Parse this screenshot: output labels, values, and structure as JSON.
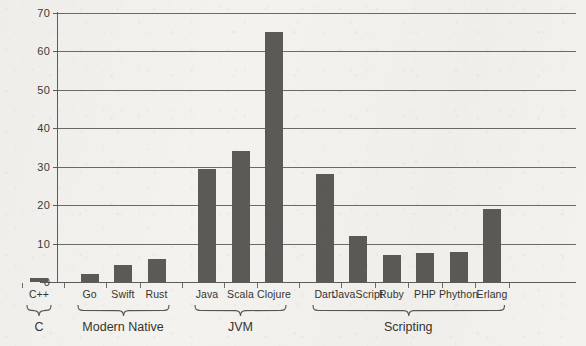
{
  "chart_data": {
    "type": "bar",
    "title": "",
    "subtitle": "",
    "xlabel": "",
    "ylabel": "",
    "ylim": [
      0,
      70
    ],
    "yticks": [
      0,
      10,
      20,
      30,
      40,
      50,
      60,
      70
    ],
    "grid": true,
    "legend": false,
    "categories": [
      "C++",
      "Go",
      "Swift",
      "Rust",
      "Java",
      "Scala",
      "Clojure",
      "Dart",
      "JavaScript",
      "Ruby",
      "PHP",
      "Phython",
      "Erlang"
    ],
    "values": [
      1,
      2,
      4.5,
      6,
      29.5,
      34,
      65,
      28,
      12,
      7,
      7.5,
      7.8,
      19
    ],
    "bar_color": "#5b5a57",
    "background_color": "#f4f2ee",
    "axis_color": "#5f5d59",
    "groups": [
      {
        "label": "C",
        "members": [
          "C++"
        ]
      },
      {
        "label": "Modern Native",
        "members": [
          "Go",
          "Swift",
          "Rust"
        ]
      },
      {
        "label": "JVM",
        "members": [
          "Java",
          "Scala",
          "Clojure"
        ]
      },
      {
        "label": "Scripting",
        "members": [
          "Dart",
          "JavaScript",
          "Ruby",
          "PHP",
          "Phython",
          "Erlang"
        ]
      }
    ]
  }
}
